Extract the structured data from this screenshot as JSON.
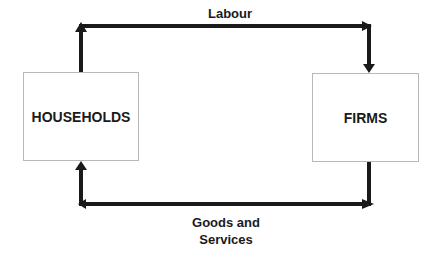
{
  "diagram": {
    "nodes": [
      {
        "id": "households",
        "label": "HOUSEHOLDS"
      },
      {
        "id": "firms",
        "label": "FIRMS"
      }
    ],
    "flows": [
      {
        "from": "households",
        "to": "firms",
        "label": "Labour",
        "position": "top"
      },
      {
        "from": "firms",
        "to": "households",
        "label_line1": "Goods and",
        "label_line2": "Services",
        "position": "bottom"
      }
    ],
    "colors": {
      "arrow": "#1a1a1a",
      "box_border": "#b8b8b8",
      "text": "#1a1a1a"
    }
  }
}
